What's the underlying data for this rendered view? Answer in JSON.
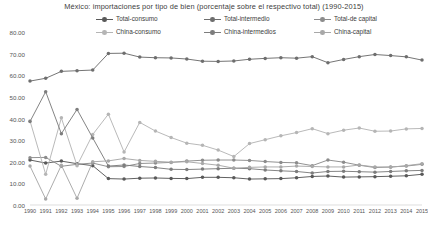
{
  "chart_data": {
    "type": "line",
    "title": "México: importaciones por tipo de bien (porcentaje sobre el respectivo total) (1990-2015)",
    "xlabel": "",
    "ylabel": "",
    "ylim": [
      0,
      80
    ],
    "ytick_step": 10,
    "yticks": [
      "0.00",
      "10.00",
      "20.00",
      "30.00",
      "40.00",
      "50.00",
      "60.00",
      "70.00",
      "80.00"
    ],
    "grid": false,
    "legend_position": "top-center",
    "x": [
      1990,
      1991,
      1992,
      1993,
      1994,
      1995,
      1996,
      1997,
      1998,
      1999,
      2000,
      2001,
      2002,
      2003,
      2004,
      2005,
      2006,
      2007,
      2008,
      2009,
      2010,
      2011,
      2012,
      2013,
      2014,
      2015
    ],
    "categories": [
      "1990",
      "1991",
      "1992",
      "1993",
      "1994",
      "1995",
      "1996",
      "1997",
      "1998",
      "1999",
      "2000",
      "2001",
      "2002",
      "2003",
      "2004",
      "2005",
      "2006",
      "2007",
      "2008",
      "2009",
      "2010",
      "2011",
      "2012",
      "2013",
      "2014",
      "2015"
    ],
    "series": [
      {
        "name": "Total-consumo",
        "color": "#595959",
        "marker": "circle",
        "values": [
          20.8,
          19.4,
          20.3,
          19.1,
          18.2,
          12.2,
          12.0,
          12.4,
          12.5,
          12.3,
          12.2,
          12.8,
          12.8,
          12.6,
          12.0,
          12.1,
          12.2,
          12.6,
          13.2,
          13.4,
          12.9,
          13.0,
          13.1,
          13.3,
          13.5,
          14.2
        ]
      },
      {
        "name": "Total-intermedio",
        "color": "#6e6e6e",
        "marker": "circle",
        "values": [
          57.3,
          58.6,
          61.8,
          62.1,
          62.4,
          70.1,
          70.2,
          68.4,
          68.1,
          68.0,
          67.5,
          66.5,
          66.4,
          66.6,
          67.4,
          67.8,
          68.1,
          67.9,
          68.6,
          65.8,
          67.3,
          68.6,
          69.6,
          69.1,
          68.5,
          67.0
        ]
      },
      {
        "name": "Total-de capital",
        "color": "#8c8c8c",
        "marker": "circle",
        "values": [
          21.9,
          22.0,
          17.9,
          18.8,
          19.4,
          17.7,
          17.8,
          19.2,
          19.4,
          19.7,
          20.3,
          20.7,
          20.8,
          20.8,
          20.6,
          20.1,
          19.7,
          19.5,
          18.2,
          20.8,
          19.8,
          18.4,
          17.3,
          17.6,
          18.0,
          18.8
        ]
      },
      {
        "name": "China-consumo",
        "color": "#b5b5b5",
        "marker": "circle",
        "values": [
          38.9,
          14.2,
          40.3,
          18.2,
          32.6,
          42.0,
          24.5,
          38.2,
          34.2,
          31.2,
          28.6,
          27.6,
          25.4,
          22.4,
          28.4,
          30.2,
          32.0,
          33.5,
          35.3,
          33.0,
          34.6,
          35.6,
          34.1,
          34.2,
          35.2,
          35.4
        ]
      },
      {
        "name": "China-intermedios",
        "color": "#7d7d7d",
        "marker": "circle",
        "values": [
          38.6,
          52.4,
          33.0,
          44.2,
          31.0,
          18.0,
          18.5,
          17.8,
          17.3,
          16.5,
          16.4,
          16.6,
          16.8,
          17.0,
          16.8,
          16.2,
          15.8,
          15.5,
          14.8,
          15.5,
          15.6,
          15.4,
          15.2,
          15.5,
          15.8,
          16.0
        ]
      },
      {
        "name": "China-capital",
        "color": "#a8a8a8",
        "marker": "circle",
        "values": [
          18.0,
          2.8,
          18.4,
          3.1,
          20.0,
          20.4,
          21.5,
          20.6,
          20.2,
          19.8,
          20.0,
          19.2,
          18.4,
          17.0,
          17.4,
          17.6,
          17.6,
          18.0,
          17.8,
          17.6,
          17.6,
          18.5,
          17.6,
          17.5,
          18.2,
          19.1
        ]
      }
    ]
  },
  "legend": {
    "items": [
      {
        "label": "Total-consumo"
      },
      {
        "label": "Total-intermedio"
      },
      {
        "label": "Total-de capital"
      },
      {
        "label": "China-consumo"
      },
      {
        "label": "China-intermedios"
      },
      {
        "label": "China-capital"
      }
    ]
  }
}
